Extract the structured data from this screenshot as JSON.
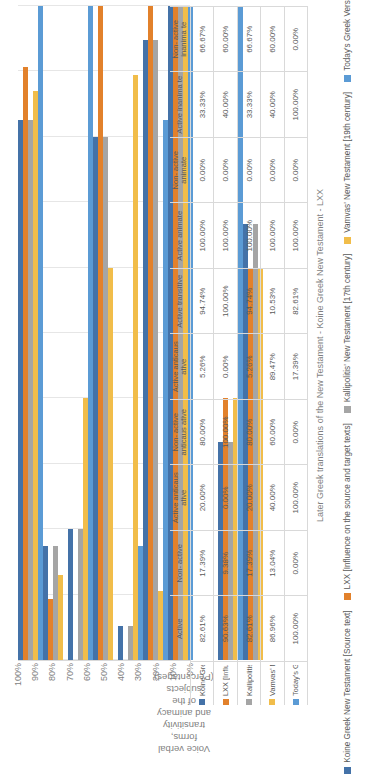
{
  "chart_data": {
    "type": "bar",
    "orientation": "horizontal-grouped-with-data-table",
    "title": "",
    "xlabel": "Later Greek translations of the New Testament - Koine Greek New Testament - LXX",
    "ylabel": "Voice verbal forms, transitivity and animacy of the subjects (Percentages)",
    "ylim": [
      0,
      100
    ],
    "grid": true,
    "legend_position": "bottom",
    "tick_labels": [
      "100%",
      "90%",
      "80%",
      "70%",
      "60%",
      "50%",
      "40%",
      "30%",
      "20%",
      "10%",
      "0%"
    ],
    "categories": [
      "Active",
      "Non-active",
      "Active anticausative",
      "Non-active anticausative",
      "Active transitive",
      "Active anticausative",
      "Active animate",
      "Non-active animate",
      "Active inanimate",
      "Non-active inanimate"
    ],
    "series": [
      {
        "name": "Koine Greek New Testament [Source text]",
        "color": "#4472a8",
        "values": [
          82.61,
          17.39,
          20.0,
          80.0,
          5.26,
          94.74,
          100.0,
          0.0,
          33.33,
          66.67
        ],
        "labels": [
          "82.61%",
          "17.39%",
          "20.00%",
          "80.00%",
          "5.26%",
          "94.74%",
          "100.00%",
          "0.00%",
          "33.33%",
          "66.67%"
        ]
      },
      {
        "name": "LXX [Influence on the source and target texts]",
        "color": "#e2812b",
        "values": [
          90.63,
          9.38,
          0.0,
          100.0,
          0.0,
          100.0,
          100.0,
          0.0,
          40.0,
          60.0
        ],
        "labels": [
          "90.63%",
          "9.38%",
          "0.00%",
          "100.00%",
          "0.00%",
          "100.00%",
          "100.00%",
          "0.00%",
          "40.00%",
          "60.00%"
        ]
      },
      {
        "name": "Kallipolitis' New Testament  [17th century]",
        "color": "#a5a5a5",
        "values": [
          82.61,
          17.39,
          20.0,
          80.0,
          5.26,
          94.74,
          100.0,
          0.0,
          33.33,
          66.67
        ],
        "labels": [
          "82.61%",
          "17.39%",
          "20.00%",
          "80.00%",
          "5.26%",
          "94.74%",
          "100.00%",
          "0.00%",
          "33.33%",
          "66.67%"
        ]
      },
      {
        "name": "Vamvas' New Testament  [19th century]",
        "color": "#f1bd4a",
        "values": [
          86.96,
          13.04,
          40.0,
          60.0,
          89.47,
          10.53,
          100.0,
          0.0,
          40.0,
          60.0
        ],
        "labels": [
          "86.96%",
          "13.04%",
          "40.00%",
          "60.00%",
          "89.47%",
          "10.53%",
          "100.00%",
          "0.00%",
          "40.00%",
          "60.00%"
        ]
      },
      {
        "name": "Today's Greek Version [20th century]",
        "color": "#5b9bd5",
        "values": [
          100.0,
          0.0,
          100.0,
          0.0,
          17.39,
          82.61,
          100.0,
          0.0,
          100.0,
          0.0
        ],
        "labels": [
          "100.00%",
          "0.00%",
          "100.00%",
          "0.00%",
          "17.39%",
          "82.61%",
          "100.00%",
          "0.00%",
          "100.00%",
          "0.00%"
        ]
      }
    ],
    "table": {
      "category_groups": [
        {
          "label": "Active",
          "sub": [
            "Active",
            "Non-active"
          ]
        },
        {
          "label": "Active anticausative",
          "sub": [
            "Active anticausative",
            "Non-active anticausative"
          ]
        },
        {
          "label": "Active transitive",
          "sub": [
            "Active transitive",
            "Active anticausative"
          ]
        },
        {
          "label": "Active animate",
          "sub": [
            "Active animate",
            "Non-active animate"
          ]
        },
        {
          "label": "Active inanimate",
          "sub": [
            "Active inanimate",
            "Non-active inanimate"
          ]
        }
      ],
      "column_headers": [
        [
          "Active",
          "Non-\nactive"
        ],
        [
          "Active\nanticaus\native",
          "Non-\nactive\nanticaus\native"
        ],
        [
          "Active\nanticaus\native",
          "Active\ntransitive"
        ],
        [
          "Active\nanimate",
          "Non-\nactive\nanimate"
        ],
        [
          "Active\ninanima\nte",
          "Non-\nactive\ninanima\nte"
        ]
      ]
    }
  }
}
